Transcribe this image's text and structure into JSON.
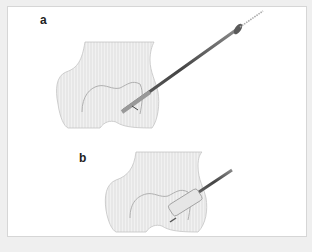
{
  "figure": {
    "panels": [
      {
        "label": "a",
        "description": "Femoral condyle with long guide instrument inserted obliquely, guide wire tip and arrow indicating direction"
      },
      {
        "label": "b",
        "description": "Femoral condyle with reamer/cannula advanced into the condyle"
      }
    ],
    "colors": {
      "background": "#efefef",
      "panel": "#ffffff",
      "border": "#d6d6d6",
      "bone_fill": "#ececec",
      "bone_stroke": "#b8b8b8",
      "instrument": "#555555"
    }
  }
}
